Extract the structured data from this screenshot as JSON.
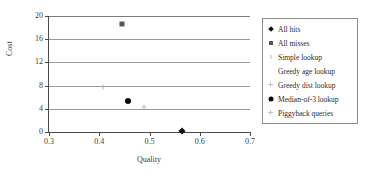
{
  "chart_data": {
    "type": "scatter",
    "title": "",
    "xlabel": "Quality",
    "ylabel": "Cost",
    "xlim": [
      0.3,
      0.7
    ],
    "ylim": [
      0,
      20
    ],
    "xticks": [
      "0.3",
      "0.4",
      "0.5",
      "0.6",
      "0.7"
    ],
    "yticks": [
      "0",
      "4",
      "8",
      "12",
      "16",
      "20"
    ],
    "grid": "horizontal",
    "legend_position": "right",
    "series": [
      {
        "name": "All hits",
        "marker": "diamond",
        "color": "#111111",
        "points": [
          {
            "x": 0.565,
            "y": 0.1
          }
        ]
      },
      {
        "name": "All misses",
        "marker": "square",
        "color": "#555555",
        "points": [
          {
            "x": 0.445,
            "y": 18.7
          }
        ]
      },
      {
        "name": "Simple lookup",
        "marker": "tick",
        "color": "#b4b4b4",
        "points": [
          {
            "x": 0.408,
            "y": 7.8
          }
        ]
      },
      {
        "name": "Greedy age lookup",
        "marker": "none",
        "color": "#c8c8c8",
        "points": []
      },
      {
        "name": "Greedy dist lookup",
        "marker": "plus",
        "color": "#bdbdbd",
        "points": [
          {
            "x": 0.49,
            "y": 4.3
          }
        ]
      },
      {
        "name": "Median-of-3 lookup",
        "marker": "circle",
        "color": "#0a0a0a",
        "points": [
          {
            "x": 0.458,
            "y": 5.4
          }
        ]
      },
      {
        "name": "Piggyback queries",
        "marker": "plus",
        "color": "#c4c4c4",
        "points": []
      }
    ]
  },
  "axes": {
    "y_title": "Cost",
    "x_title": "Quality",
    "y_tick_labels": [
      "0",
      "4",
      "8",
      "12",
      "16",
      "20"
    ],
    "x_tick_labels": [
      "0.3",
      "0.4",
      "0.5",
      "0.6",
      "0.7"
    ]
  },
  "legend": {
    "items": [
      {
        "label": "All hits",
        "marker": "diamond-marker"
      },
      {
        "label": "All misses",
        "marker": "square-marker"
      },
      {
        "label": "Simple lookup",
        "marker": "tick-marker"
      },
      {
        "label": "Greedy age lookup",
        "marker": "blank-marker"
      },
      {
        "label": "Greedy dist lookup",
        "marker": "plus-marker"
      },
      {
        "label": "Median-of-3 lookup",
        "marker": "circle-marker"
      },
      {
        "label": "Piggyback queries",
        "marker": "plus-marker"
      }
    ]
  }
}
